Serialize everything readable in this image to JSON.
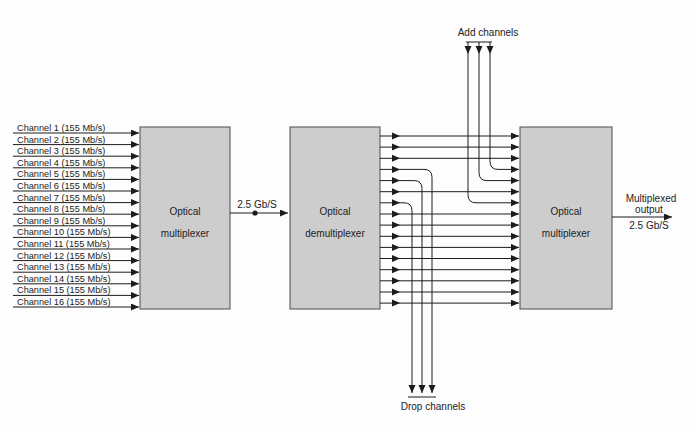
{
  "diagram": {
    "blocks": {
      "left_mux": {
        "line1": "Optical",
        "line2": "multiplexer"
      },
      "demux": {
        "line1": "Optical",
        "line2": "demultiplexer"
      },
      "right_mux": {
        "line1": "Optical",
        "line2": "multiplexer"
      }
    },
    "labels": {
      "mid_link": "2.5 Gb/S",
      "add": "Add channels",
      "drop": "Drop channels",
      "output_line1": "Multiplexed",
      "output_line2": "output",
      "output_line3": "2.5 Gb/S"
    },
    "channels": [
      "Channel 1 (155 Mb/s)",
      "Channel 2 (155 Mb/s)",
      "Channel 3 (155 Mb/s)",
      "Channel 4 (155 Mb/s)",
      "Channel 5 (155 Mb/s)",
      "Channel 6 (155 Mb/s)",
      "Channel 7 (155 Mb/s)",
      "Channel 8 (155 Mb/s)",
      "Channel 9 (155 Mb/s)",
      "Channel 10 (155 Mb/s)",
      "Channel 11 (155 Mb/s)",
      "Channel 12 (155 Mb/s)",
      "Channel 13 (155 Mb/s)",
      "Channel 14 (155 Mb/s)",
      "Channel 15 (155 Mb/s)",
      "Channel 16 (155 Mb/s)"
    ],
    "wavelength_row_count": 16,
    "add_drop_rows": [
      4,
      5,
      7
    ],
    "colors": {
      "background": "#fdfdfd",
      "box_fill": "#cdcdcd",
      "box_border": "#4d4d4d",
      "line": "#1c1c1c",
      "text": "#1c1c1c"
    }
  }
}
